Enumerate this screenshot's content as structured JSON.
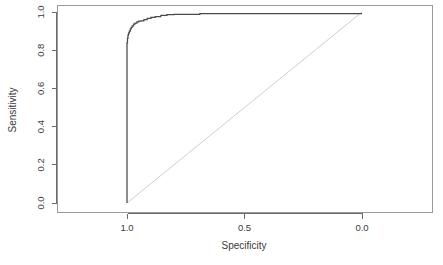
{
  "chart_data": {
    "type": "line",
    "title": "",
    "subtitle": "",
    "xlabel": "Specificity",
    "ylabel": "Sensitivity",
    "xlim": [
      1.0,
      0.0
    ],
    "ylim": [
      0.0,
      1.0
    ],
    "x_reversed": true,
    "grid": false,
    "legend": null,
    "legend_position": "none",
    "x_ticks": [
      "1.0",
      "0.5",
      "0.0"
    ],
    "x_tick_values": [
      1.0,
      0.5,
      0.0
    ],
    "y_ticks": [
      "0.0",
      "0.2",
      "0.4",
      "0.6",
      "0.8",
      "1.0"
    ],
    "y_tick_values": [
      0.0,
      0.2,
      0.4,
      0.6,
      0.8,
      1.0
    ],
    "series": [
      {
        "name": "ROC curve",
        "style": "step",
        "color": "#4a4a4a",
        "x": [
          1.0,
          1.0,
          0.998,
          0.998,
          0.996,
          0.996,
          0.994,
          0.994,
          0.992,
          0.992,
          0.99,
          0.99,
          0.986,
          0.986,
          0.982,
          0.982,
          0.978,
          0.978,
          0.972,
          0.972,
          0.966,
          0.966,
          0.958,
          0.958,
          0.95,
          0.95,
          0.94,
          0.94,
          0.928,
          0.928,
          0.914,
          0.914,
          0.898,
          0.898,
          0.88,
          0.88,
          0.856,
          0.856,
          0.83,
          0.83,
          0.8,
          0.8,
          0.69,
          0.69,
          0.0
        ],
        "y": [
          0.0,
          0.838,
          0.838,
          0.862,
          0.862,
          0.878,
          0.878,
          0.886,
          0.886,
          0.892,
          0.892,
          0.9,
          0.9,
          0.912,
          0.912,
          0.92,
          0.92,
          0.928,
          0.928,
          0.936,
          0.936,
          0.942,
          0.942,
          0.948,
          0.948,
          0.952,
          0.952,
          0.954,
          0.954,
          0.96,
          0.96,
          0.966,
          0.966,
          0.972,
          0.972,
          0.976,
          0.976,
          0.982,
          0.982,
          0.986,
          0.986,
          0.988,
          0.988,
          0.992,
          0.992
        ]
      },
      {
        "name": "Chance diagonal",
        "style": "line",
        "color": "#cfcfcf",
        "x": [
          1.0,
          0.0
        ],
        "y": [
          0.0,
          1.0
        ]
      }
    ]
  },
  "axes": {
    "x_title": "Specificity",
    "y_title": "Sensitivity"
  }
}
